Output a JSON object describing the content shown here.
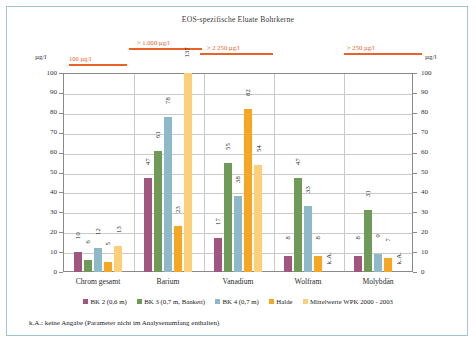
{
  "chart": {
    "title": "EOS-spezifische Eluate Bohrkerne",
    "axis_unit_left": "µg/l",
    "axis_unit_right": "µg/l",
    "footnote": "k.A.: keine Angabe (Parameter nicht im Analysenumfang enthalten)"
  },
  "legend": {
    "items": [
      {
        "label": "BK 2 (0,6 m)",
        "color": "#a0567e"
      },
      {
        "label": "BK 3 (0,7 m, Bankett)",
        "color": "#6f9a58"
      },
      {
        "label": "BK 4 (0,7 m)",
        "color": "#8fb8c9"
      },
      {
        "label": "Halde",
        "color": "#f5a623"
      },
      {
        "label": "Mittelwerte WPK 2000 - 2003",
        "color": "#fbd079"
      }
    ]
  },
  "annotations": {
    "threshold_100": "100 µg/l",
    "threshold_1000": "> 1.000 µg/l",
    "threshold_2250": "> 2 250 µg/l",
    "threshold_250": "> 250 µg/l",
    "clipped_value_barium_mittelwerte": "137"
  },
  "chart_data": {
    "type": "bar",
    "title": "EOS-spezifische Eluate Bohrkerne",
    "xlabel": "",
    "ylabel": "µg/l",
    "ylim": [
      0,
      100
    ],
    "yticks": [
      0,
      10,
      20,
      30,
      40,
      50,
      60,
      70,
      80,
      90,
      100
    ],
    "grid": true,
    "legend_position": "bottom",
    "categories": [
      "Chrom gesamt",
      "Barium",
      "Vanadium",
      "Wolfram",
      "Molybdän"
    ],
    "series": [
      {
        "name": "BK 2 (0,6 m)",
        "color": "#a0567e",
        "values": [
          10,
          47,
          17,
          8,
          8
        ],
        "labels": [
          "10",
          "47",
          "17",
          "8",
          "8"
        ]
      },
      {
        "name": "BK 3 (0,7 m, Bankett)",
        "color": "#6f9a58",
        "values": [
          6,
          61,
          55,
          47,
          31
        ],
        "labels": [
          "6",
          "61",
          "55",
          "47",
          "31"
        ]
      },
      {
        "name": "BK 4 (0,7 m)",
        "color": "#8fb8c9",
        "values": [
          12,
          78,
          38,
          33,
          9
        ],
        "labels": [
          "12",
          "78",
          "38",
          "33",
          "9"
        ]
      },
      {
        "name": "Halde",
        "color": "#f5a623",
        "values": [
          5,
          23,
          82,
          8,
          7
        ],
        "labels": [
          "5",
          "23",
          "82",
          "8",
          "7"
        ]
      },
      {
        "name": "Mittelwerte WPK 2000 - 2003",
        "color": "#fbd079",
        "values": [
          13,
          137,
          54,
          null,
          null
        ],
        "labels": [
          "13",
          "137",
          "54",
          "k.A.",
          "k.A."
        ],
        "clipped": [
          false,
          true,
          false,
          false,
          false
        ]
      }
    ],
    "threshold_lines": [
      {
        "label": "100 µg/l",
        "category": "Chrom gesamt",
        "value": 100,
        "color": "#e8622a"
      },
      {
        "label": "> 1.000 µg/l",
        "category": "Barium",
        "value": 1000,
        "color": "#e8622a"
      },
      {
        "label": "> 2 250 µg/l",
        "category": "Vanadium",
        "value": 2250,
        "color": "#e8622a"
      },
      {
        "label": "> 250 µg/l",
        "category": "Molybdän",
        "value": 250,
        "color": "#e8622a"
      }
    ]
  }
}
